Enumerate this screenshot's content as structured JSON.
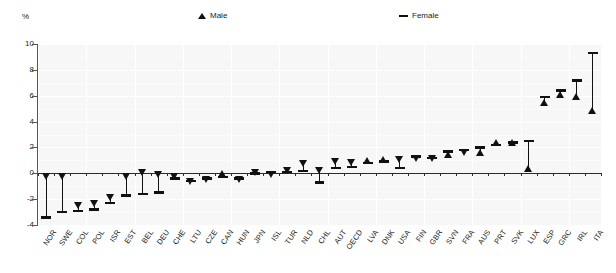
{
  "chart_data": {
    "type": "scatter",
    "title": "",
    "subtitle": "",
    "xlabel": "",
    "ylabel": "%",
    "unit_label": "%",
    "ylim": [
      -4,
      10
    ],
    "yticks": [
      -4,
      -2,
      0,
      2,
      4,
      6,
      8,
      10
    ],
    "ytick_labels": [
      "-4",
      "-2",
      "0",
      "2",
      "4",
      "6",
      "8",
      "10"
    ],
    "grid": true,
    "legend_position": "top",
    "legend": [
      {
        "name": "Male",
        "marker": "triangle-up",
        "color": "#111111"
      },
      {
        "name": "Female",
        "marker": "dash",
        "color": "#111111"
      }
    ],
    "categories": [
      "NOR",
      "SWE",
      "COL",
      "POL",
      "ISR",
      "EST",
      "BEL",
      "DEU",
      "CHE",
      "LTU",
      "CZE",
      "CAN",
      "HUN",
      "JPN",
      "ISL",
      "TUR",
      "NLD",
      "CHL",
      "AUT",
      "OECD",
      "LVA",
      "DNK",
      "USA",
      "FIN",
      "GBR",
      "SVN",
      "FRA",
      "AUS",
      "PRT",
      "SVK",
      "LUX",
      "ESP",
      "GRC",
      "IRL",
      "ITA"
    ],
    "series": [
      {
        "name": "Male",
        "marker": "triangle-up",
        "values": [
          0.0,
          0.0,
          -2.2,
          -2.1,
          -1.6,
          0.0,
          0.3,
          0.2,
          0.0,
          -0.4,
          -0.2,
          -0.3,
          -0.2,
          0.3,
          0.2,
          0.5,
          1.0,
          0.5,
          1.2,
          1.1,
          0.7,
          0.8,
          1.3,
          1.4,
          1.4,
          1.2,
          1.9,
          1.3,
          2.1,
          2.1,
          0.1,
          5.2,
          5.8,
          5.7,
          4.6
        ]
      },
      {
        "name": "Female",
        "marker": "dash",
        "values": [
          -3.4,
          -3.0,
          -2.9,
          -2.8,
          -2.3,
          -1.7,
          -1.6,
          -1.5,
          -0.4,
          -0.6,
          -0.4,
          -0.3,
          -0.4,
          0.0,
          0.1,
          0.1,
          0.2,
          -0.7,
          0.4,
          0.5,
          0.8,
          0.9,
          0.4,
          1.3,
          1.2,
          1.7,
          1.8,
          2.0,
          2.2,
          2.4,
          2.5,
          5.9,
          6.4,
          7.2,
          9.3
        ]
      }
    ]
  }
}
